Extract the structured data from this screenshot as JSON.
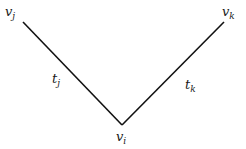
{
  "diagram": {
    "type": "v-shaped graph (two edges meeting at a vertex)",
    "nodes": [
      {
        "id": "vj",
        "label": "v",
        "subscript": "j",
        "x": 23,
        "y": 22
      },
      {
        "id": "vk",
        "label": "v",
        "subscript": "k",
        "x": 224,
        "y": 22
      },
      {
        "id": "vi",
        "label": "v",
        "subscript": "i",
        "x": 122,
        "y": 125
      }
    ],
    "edges": [
      {
        "from": "vj",
        "to": "vi",
        "label": "t",
        "subscript": "j"
      },
      {
        "from": "vi",
        "to": "vk",
        "label": "t",
        "subscript": "k"
      }
    ],
    "line_color": "#111111"
  }
}
